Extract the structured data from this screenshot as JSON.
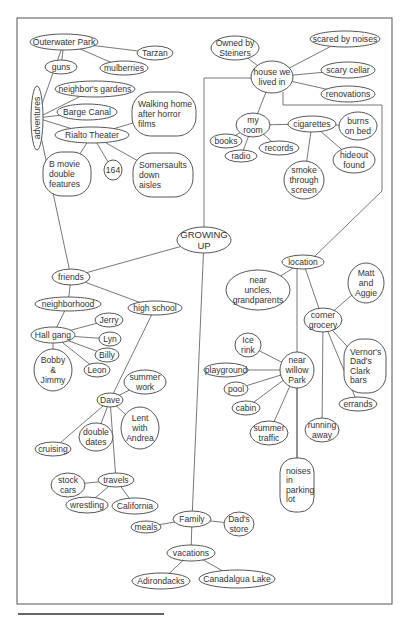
{
  "diagram": {
    "type": "mind-map",
    "root": "GROWING UP",
    "nodes": [
      {
        "id": "root",
        "label": [
          "GROWING",
          "UP"
        ],
        "cx": 204,
        "cy": 240,
        "rx": 27,
        "ry": 13,
        "root": true
      },
      {
        "id": "adventures",
        "label": [
          "adventures"
        ],
        "cx": 37,
        "cy": 118,
        "rx": 6,
        "ry": 32,
        "vertical": true
      },
      {
        "id": "outerwater",
        "label": [
          "Outerwater Park"
        ],
        "cx": 64,
        "cy": 42,
        "rx": 34,
        "ry": 8
      },
      {
        "id": "tarzan",
        "label": [
          "Tarzan"
        ],
        "cx": 155,
        "cy": 53,
        "rx": 18,
        "ry": 7
      },
      {
        "id": "guns",
        "label": [
          "guns"
        ],
        "cx": 61,
        "cy": 67,
        "rx": 16,
        "ry": 7
      },
      {
        "id": "mulberries",
        "label": [
          "mulberries"
        ],
        "cx": 124,
        "cy": 68,
        "rx": 24,
        "ry": 7
      },
      {
        "id": "neighbors_gardens",
        "label": [
          "neighbor's gardens"
        ],
        "cx": 95,
        "cy": 89,
        "rx": 40,
        "ry": 8
      },
      {
        "id": "barge_canal",
        "label": [
          "Barge Canal"
        ],
        "cx": 87,
        "cy": 112,
        "rx": 30,
        "ry": 8
      },
      {
        "id": "walking_home",
        "label": [
          "Walking home",
          "after horror",
          "films"
        ],
        "cx": 164,
        "cy": 114,
        "rx": 32,
        "ry": 22,
        "box": true
      },
      {
        "id": "rialto",
        "label": [
          "Rialto Theater"
        ],
        "cx": 92,
        "cy": 135,
        "rx": 37,
        "ry": 8
      },
      {
        "id": "b_movie",
        "label": [
          "B movie",
          "double",
          "features"
        ],
        "cx": 67,
        "cy": 174,
        "rx": 24,
        "ry": 22,
        "box": true
      },
      {
        "id": "164",
        "label": [
          "164"
        ],
        "cx": 113,
        "cy": 170,
        "rx": 9,
        "ry": 10
      },
      {
        "id": "somersaults",
        "label": [
          "Somersaults",
          "down",
          "aisles"
        ],
        "cx": 163,
        "cy": 175,
        "rx": 30,
        "ry": 22,
        "box": true
      },
      {
        "id": "house",
        "label": [
          "house we",
          "lived in"
        ],
        "cx": 272,
        "cy": 77,
        "rx": 21,
        "ry": 16
      },
      {
        "id": "steiners",
        "label": [
          "Owned by",
          "Steiners"
        ],
        "cx": 235,
        "cy": 48,
        "rx": 24,
        "ry": 12
      },
      {
        "id": "scared_noises",
        "label": [
          "scared by noises"
        ],
        "cx": 345,
        "cy": 39,
        "rx": 35,
        "ry": 8
      },
      {
        "id": "scary_cellar",
        "label": [
          "scary cellar"
        ],
        "cx": 348,
        "cy": 70,
        "rx": 27,
        "ry": 8
      },
      {
        "id": "renovations",
        "label": [
          "renovations"
        ],
        "cx": 348,
        "cy": 94,
        "rx": 27,
        "ry": 8
      },
      {
        "id": "my_room",
        "label": [
          "my",
          "room"
        ],
        "cx": 253,
        "cy": 125,
        "rx": 17,
        "ry": 12
      },
      {
        "id": "books",
        "label": [
          "books"
        ],
        "cx": 226,
        "cy": 141,
        "rx": 16,
        "ry": 7
      },
      {
        "id": "radio",
        "label": [
          "radio"
        ],
        "cx": 241,
        "cy": 156,
        "rx": 16,
        "ry": 6
      },
      {
        "id": "records",
        "label": [
          "records"
        ],
        "cx": 279,
        "cy": 148,
        "rx": 20,
        "ry": 7
      },
      {
        "id": "cigarettes",
        "label": [
          "cigarettes"
        ],
        "cx": 312,
        "cy": 124,
        "rx": 24,
        "ry": 8
      },
      {
        "id": "burns",
        "label": [
          "burns",
          "on bed"
        ],
        "cx": 358,
        "cy": 126,
        "rx": 19,
        "ry": 14
      },
      {
        "id": "hideout",
        "label": [
          "hideout",
          "found"
        ],
        "cx": 354,
        "cy": 160,
        "rx": 21,
        "ry": 13
      },
      {
        "id": "smoke",
        "label": [
          "smoke",
          "through",
          "screen"
        ],
        "cx": 304,
        "cy": 180,
        "rx": 20,
        "ry": 19
      },
      {
        "id": "location",
        "label": [
          "location"
        ],
        "cx": 303,
        "cy": 262,
        "rx": 21,
        "ry": 7
      },
      {
        "id": "near_uncles",
        "label": [
          "near",
          "uncles,",
          "grandparents"
        ],
        "cx": 258,
        "cy": 290,
        "rx": 32,
        "ry": 20
      },
      {
        "id": "matt_aggie",
        "label": [
          "Matt",
          "and",
          "Aggie"
        ],
        "cx": 366,
        "cy": 283,
        "rx": 18,
        "ry": 20
      },
      {
        "id": "corner_grocery",
        "label": [
          "corner",
          "grocery"
        ],
        "cx": 323,
        "cy": 320,
        "rx": 19,
        "ry": 12
      },
      {
        "id": "vernors",
        "label": [
          "Vernor's",
          "Dad's",
          "Clark",
          "bars"
        ],
        "cx": 365,
        "cy": 366,
        "rx": 21,
        "ry": 27,
        "box": true
      },
      {
        "id": "errands",
        "label": [
          "errands"
        ],
        "cx": 358,
        "cy": 404,
        "rx": 19,
        "ry": 7
      },
      {
        "id": "running_away",
        "label": [
          "running",
          "away"
        ],
        "cx": 322,
        "cy": 430,
        "rx": 17,
        "ry": 12
      },
      {
        "id": "near_willow",
        "label": [
          "near",
          "willow",
          "Park"
        ],
        "cx": 297,
        "cy": 370,
        "rx": 17,
        "ry": 18
      },
      {
        "id": "ice_rink",
        "label": [
          "Ice",
          "rink"
        ],
        "cx": 248,
        "cy": 345,
        "rx": 13,
        "ry": 12
      },
      {
        "id": "playground",
        "label": [
          "playground"
        ],
        "cx": 226,
        "cy": 370,
        "rx": 22,
        "ry": 7
      },
      {
        "id": "pool",
        "label": [
          "pool"
        ],
        "cx": 236,
        "cy": 389,
        "rx": 12,
        "ry": 7
      },
      {
        "id": "cabin",
        "label": [
          "cabin"
        ],
        "cx": 246,
        "cy": 408,
        "rx": 14,
        "ry": 7
      },
      {
        "id": "summer_traffic",
        "label": [
          "summer",
          "traffic"
        ],
        "cx": 269,
        "cy": 433,
        "rx": 19,
        "ry": 12
      },
      {
        "id": "noises_parking",
        "label": [
          "noises",
          "in",
          "parking",
          "lot"
        ],
        "cx": 297,
        "cy": 485,
        "rx": 17,
        "ry": 27,
        "box": true
      },
      {
        "id": "friends",
        "label": [
          "friends"
        ],
        "cx": 71,
        "cy": 277,
        "rx": 19,
        "ry": 8
      },
      {
        "id": "neighborhood",
        "label": [
          "neighborhood"
        ],
        "cx": 68,
        "cy": 304,
        "rx": 33,
        "ry": 7
      },
      {
        "id": "high_school",
        "label": [
          "high school"
        ],
        "cx": 155,
        "cy": 308,
        "rx": 27,
        "ry": 7
      },
      {
        "id": "hall_gang",
        "label": [
          "Hall gang"
        ],
        "cx": 53,
        "cy": 335,
        "rx": 22,
        "ry": 8
      },
      {
        "id": "jerry",
        "label": [
          "Jerry"
        ],
        "cx": 109,
        "cy": 320,
        "rx": 14,
        "ry": 7
      },
      {
        "id": "lyn",
        "label": [
          "Lyn"
        ],
        "cx": 110,
        "cy": 339,
        "rx": 11,
        "ry": 7
      },
      {
        "id": "billy",
        "label": [
          "Billy"
        ],
        "cx": 107,
        "cy": 355,
        "rx": 12,
        "ry": 7
      },
      {
        "id": "leon",
        "label": [
          "Leon"
        ],
        "cx": 97,
        "cy": 370,
        "rx": 13,
        "ry": 7
      },
      {
        "id": "bobby_jimmy",
        "label": [
          "Bobby",
          "&",
          "Jimmy"
        ],
        "cx": 53,
        "cy": 370,
        "rx": 19,
        "ry": 21
      },
      {
        "id": "dave",
        "label": [
          "Dave"
        ],
        "cx": 110,
        "cy": 400,
        "rx": 13,
        "ry": 7
      },
      {
        "id": "summer_work",
        "label": [
          "summer",
          "work"
        ],
        "cx": 145,
        "cy": 382,
        "rx": 21,
        "ry": 12
      },
      {
        "id": "lent_andrea",
        "label": [
          "Lent",
          "with",
          "Andrea"
        ],
        "cx": 140,
        "cy": 428,
        "rx": 19,
        "ry": 21
      },
      {
        "id": "double_dates",
        "label": [
          "double",
          "dates"
        ],
        "cx": 96,
        "cy": 437,
        "rx": 17,
        "ry": 14
      },
      {
        "id": "cruising",
        "label": [
          "cruising"
        ],
        "cx": 53,
        "cy": 449,
        "rx": 18,
        "ry": 7
      },
      {
        "id": "travels",
        "label": [
          "travels"
        ],
        "cx": 116,
        "cy": 480,
        "rx": 18,
        "ry": 7
      },
      {
        "id": "stock_cars",
        "label": [
          "stock",
          "cars"
        ],
        "cx": 68,
        "cy": 485,
        "rx": 17,
        "ry": 12
      },
      {
        "id": "wrestling",
        "label": [
          "wrestling"
        ],
        "cx": 87,
        "cy": 505,
        "rx": 21,
        "ry": 8
      },
      {
        "id": "california",
        "label": [
          "California"
        ],
        "cx": 135,
        "cy": 506,
        "rx": 23,
        "ry": 8
      },
      {
        "id": "family",
        "label": [
          "Family"
        ],
        "cx": 192,
        "cy": 519,
        "rx": 19,
        "ry": 8
      },
      {
        "id": "meals",
        "label": [
          "meals"
        ],
        "cx": 146,
        "cy": 527,
        "rx": 15,
        "ry": 6
      },
      {
        "id": "dads_store",
        "label": [
          "Dad's",
          "store"
        ],
        "cx": 239,
        "cy": 524,
        "rx": 15,
        "ry": 12
      },
      {
        "id": "vacations",
        "label": [
          "vacations"
        ],
        "cx": 191,
        "cy": 553,
        "rx": 24,
        "ry": 8
      },
      {
        "id": "adirondacks",
        "label": [
          "Adirondacks"
        ],
        "cx": 161,
        "cy": 581,
        "rx": 29,
        "ry": 8
      },
      {
        "id": "canadalgua",
        "label": [
          "Canadalgua Lake"
        ],
        "cx": 237,
        "cy": 579,
        "rx": 38,
        "ry": 9
      }
    ],
    "edges": [
      [
        "adventures",
        "outerwater"
      ],
      [
        "outerwater",
        "tarzan"
      ],
      [
        "outerwater",
        "guns"
      ],
      [
        "outerwater",
        "mulberries"
      ],
      [
        "adventures",
        "neighbors_gardens"
      ],
      [
        "adventures",
        "barge_canal"
      ],
      [
        "adventures",
        "rialto"
      ],
      [
        "rialto",
        "walking_home"
      ],
      [
        "rialto",
        "b_movie"
      ],
      [
        "rialto",
        "164"
      ],
      [
        "rialto",
        "somersaults"
      ],
      [
        "adventures",
        "friends"
      ],
      [
        "house",
        "steiners"
      ],
      [
        "house",
        "scared_noises"
      ],
      [
        "house",
        "scary_cellar"
      ],
      [
        "house",
        "renovations"
      ],
      [
        "house",
        "my_room"
      ],
      [
        "my_room",
        "books"
      ],
      [
        "my_room",
        "radio"
      ],
      [
        "my_room",
        "records"
      ],
      [
        "my_room",
        "cigarettes"
      ],
      [
        "cigarettes",
        "burns"
      ],
      [
        "cigarettes",
        "hideout"
      ],
      [
        "cigarettes",
        "smoke"
      ],
      [
        "location",
        "near_uncles"
      ],
      [
        "location",
        "corner_grocery"
      ],
      [
        "location",
        "near_willow_line"
      ],
      [
        "corner_grocery",
        "matt_aggie"
      ],
      [
        "corner_grocery",
        "vernors"
      ],
      [
        "corner_grocery",
        "errands"
      ],
      [
        "corner_grocery",
        "running_away"
      ],
      [
        "near_willow",
        "ice_rink"
      ],
      [
        "near_willow",
        "playground"
      ],
      [
        "near_willow",
        "pool"
      ],
      [
        "near_willow",
        "cabin"
      ],
      [
        "near_willow",
        "summer_traffic"
      ],
      [
        "near_willow",
        "noises_parking"
      ],
      [
        "root",
        "friends"
      ],
      [
        "friends",
        "neighborhood"
      ],
      [
        "friends",
        "high_school"
      ],
      [
        "neighborhood",
        "hall_gang"
      ],
      [
        "hall_gang",
        "jerry"
      ],
      [
        "hall_gang",
        "lyn"
      ],
      [
        "hall_gang",
        "billy"
      ],
      [
        "hall_gang",
        "leon"
      ],
      [
        "hall_gang",
        "bobby_jimmy"
      ],
      [
        "high_school",
        "dave"
      ],
      [
        "dave",
        "summer_work"
      ],
      [
        "dave",
        "lent_andrea"
      ],
      [
        "dave",
        "double_dates"
      ],
      [
        "dave",
        "cruising"
      ],
      [
        "dave",
        "travels"
      ],
      [
        "travels",
        "stock_cars"
      ],
      [
        "travels",
        "wrestling"
      ],
      [
        "travels",
        "california"
      ],
      [
        "root",
        "family"
      ],
      [
        "family",
        "meals"
      ],
      [
        "family",
        "dads_store"
      ],
      [
        "family",
        "vacations"
      ],
      [
        "vacations",
        "adirondacks"
      ],
      [
        "vacations",
        "canadalgua"
      ]
    ]
  }
}
